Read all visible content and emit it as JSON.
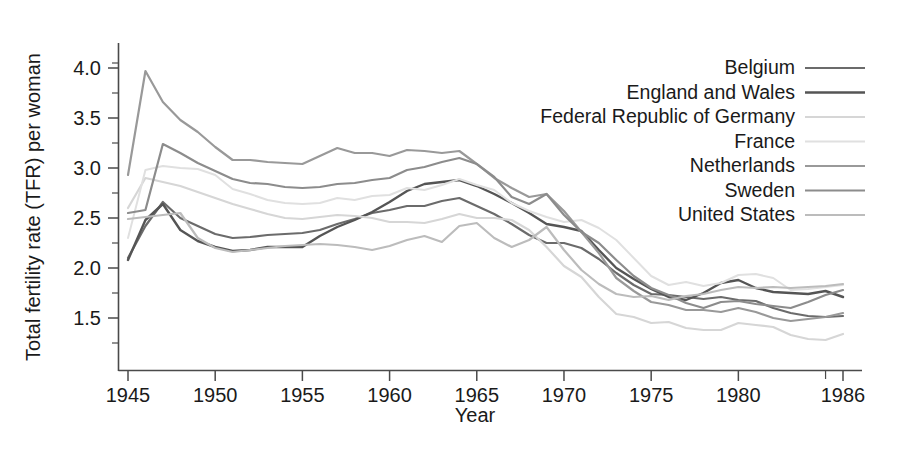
{
  "chart_data": {
    "type": "line",
    "title": "",
    "xlabel": "Year",
    "ylabel": "Total fertility rate (TFR) per woman",
    "xlim": [
      1945,
      1986
    ],
    "ylim": [
      1.15,
      4.15
    ],
    "grid": false,
    "legend_position": "top-right",
    "x_ticks": [
      1945,
      1950,
      1955,
      1960,
      1965,
      1970,
      1975,
      1980,
      1986
    ],
    "x_tick_labels": [
      "1945",
      "1950",
      "1955",
      "1960",
      "1965",
      "1970",
      "1975",
      "1980",
      "1986"
    ],
    "x_minor_ticks": [
      1985
    ],
    "y_ticks": [
      1.5,
      2.0,
      2.5,
      3.0,
      3.5,
      4.0
    ],
    "y_tick_labels": [
      "1.5",
      "2.0",
      "2.5",
      "3.0",
      "3.5",
      "4.0"
    ],
    "y_minor_ticks": [
      1.25,
      1.75,
      2.25,
      2.75,
      3.25,
      3.75,
      4.05
    ],
    "x": [
      1945,
      1946,
      1947,
      1948,
      1949,
      1950,
      1951,
      1952,
      1953,
      1954,
      1955,
      1956,
      1957,
      1958,
      1959,
      1960,
      1961,
      1962,
      1963,
      1964,
      1965,
      1966,
      1967,
      1968,
      1969,
      1970,
      1971,
      1972,
      1973,
      1974,
      1975,
      1976,
      1977,
      1978,
      1979,
      1980,
      1981,
      1982,
      1983,
      1984,
      1985,
      1986
    ],
    "series": [
      {
        "name": "Belgium",
        "color": "#6b6b6b",
        "linewidth": 2.2,
        "values": [
          2.1,
          2.42,
          2.66,
          2.5,
          2.42,
          2.34,
          2.3,
          2.31,
          2.33,
          2.34,
          2.35,
          2.38,
          2.44,
          2.49,
          2.55,
          2.58,
          2.62,
          2.62,
          2.67,
          2.7,
          2.62,
          2.54,
          2.44,
          2.33,
          2.25,
          2.25,
          2.2,
          2.09,
          1.95,
          1.83,
          1.74,
          1.73,
          1.71,
          1.69,
          1.71,
          1.68,
          1.67,
          1.6,
          1.55,
          1.52,
          1.51,
          1.52
        ]
      },
      {
        "name": "England and Wales",
        "color": "#555555",
        "linewidth": 2.4,
        "values": [
          2.08,
          2.48,
          2.64,
          2.38,
          2.27,
          2.21,
          2.17,
          2.18,
          2.21,
          2.21,
          2.21,
          2.32,
          2.41,
          2.48,
          2.56,
          2.66,
          2.77,
          2.84,
          2.86,
          2.88,
          2.82,
          2.74,
          2.65,
          2.55,
          2.44,
          2.41,
          2.37,
          2.18,
          2.0,
          1.89,
          1.79,
          1.71,
          1.68,
          1.75,
          1.85,
          1.88,
          1.8,
          1.76,
          1.75,
          1.74,
          1.77,
          1.71
        ]
      },
      {
        "name": "Federal Republic of Germany",
        "color": "#d6d6d6",
        "linewidth": 2.2,
        "values": [
          2.6,
          2.9,
          2.86,
          2.82,
          2.76,
          2.7,
          2.64,
          2.59,
          2.54,
          2.5,
          2.49,
          2.51,
          2.53,
          2.52,
          2.5,
          2.46,
          2.46,
          2.45,
          2.49,
          2.54,
          2.5,
          2.5,
          2.48,
          2.38,
          2.21,
          2.02,
          1.91,
          1.71,
          1.54,
          1.51,
          1.45,
          1.46,
          1.4,
          1.38,
          1.38,
          1.45,
          1.43,
          1.41,
          1.33,
          1.29,
          1.28,
          1.34
        ]
      },
      {
        "name": "France",
        "color": "#e0e0e0",
        "linewidth": 2.0,
        "values": [
          2.3,
          2.98,
          3.02,
          3.0,
          2.99,
          2.93,
          2.79,
          2.74,
          2.68,
          2.65,
          2.64,
          2.65,
          2.7,
          2.68,
          2.72,
          2.73,
          2.8,
          2.78,
          2.83,
          2.89,
          2.83,
          2.78,
          2.65,
          2.57,
          2.51,
          2.46,
          2.48,
          2.4,
          2.28,
          2.1,
          1.92,
          1.83,
          1.86,
          1.82,
          1.85,
          1.93,
          1.94,
          1.9,
          1.78,
          1.79,
          1.81,
          1.83
        ]
      },
      {
        "name": "Netherlands",
        "color": "#999999",
        "linewidth": 2.2,
        "values": [
          2.93,
          3.97,
          3.66,
          3.48,
          3.36,
          3.21,
          3.08,
          3.08,
          3.06,
          3.05,
          3.04,
          3.12,
          3.2,
          3.15,
          3.15,
          3.12,
          3.18,
          3.17,
          3.15,
          3.17,
          3.04,
          2.9,
          2.8,
          2.71,
          2.74,
          2.57,
          2.36,
          2.15,
          1.9,
          1.77,
          1.66,
          1.63,
          1.58,
          1.58,
          1.56,
          1.6,
          1.56,
          1.5,
          1.47,
          1.49,
          1.51,
          1.55
        ]
      },
      {
        "name": "Sweden",
        "color": "#8c8c8c",
        "linewidth": 2.2,
        "values": [
          2.55,
          2.58,
          3.24,
          3.15,
          3.05,
          2.97,
          2.89,
          2.85,
          2.84,
          2.81,
          2.8,
          2.81,
          2.84,
          2.85,
          2.88,
          2.9,
          2.98,
          3.01,
          3.06,
          3.1,
          3.04,
          2.91,
          2.71,
          2.64,
          2.74,
          2.53,
          2.36,
          2.25,
          2.08,
          1.92,
          1.8,
          1.73,
          1.65,
          1.6,
          1.66,
          1.67,
          1.64,
          1.62,
          1.6,
          1.66,
          1.73,
          1.78
        ]
      },
      {
        "name": "United States",
        "color": "#bcbcbc",
        "linewidth": 2.2,
        "values": [
          2.49,
          2.51,
          2.53,
          2.55,
          2.3,
          2.2,
          2.16,
          2.18,
          2.2,
          2.22,
          2.23,
          2.24,
          2.23,
          2.21,
          2.18,
          2.22,
          2.28,
          2.32,
          2.26,
          2.42,
          2.45,
          2.3,
          2.21,
          2.28,
          2.41,
          2.18,
          1.98,
          1.84,
          1.74,
          1.71,
          1.72,
          1.68,
          1.72,
          1.74,
          1.78,
          1.81,
          1.8,
          1.81,
          1.8,
          1.81,
          1.82,
          1.84
        ]
      }
    ]
  },
  "legend": {
    "entries": [
      {
        "label": "Belgium"
      },
      {
        "label": "England and Wales"
      },
      {
        "label": "Federal Republic of Germany"
      },
      {
        "label": "France"
      },
      {
        "label": "Netherlands"
      },
      {
        "label": "Sweden"
      },
      {
        "label": "United States"
      }
    ]
  },
  "axes": {
    "x_title": "Year",
    "y_title": "Total fertility rate (TFR) per woman"
  }
}
